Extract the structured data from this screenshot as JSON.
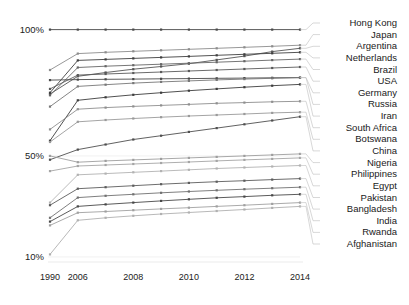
{
  "chart_data": {
    "type": "line",
    "title": "",
    "subtitle": "",
    "xlabel": "",
    "ylabel": "",
    "x": [
      1990,
      2006,
      2007,
      2008,
      2009,
      2010,
      2011,
      2012,
      2013,
      2014
    ],
    "x_tick_labels": [
      "1990",
      "2006",
      "2008",
      "2010",
      "2012",
      "2014"
    ],
    "x_ticks": [
      1990,
      2006,
      2008,
      2010,
      2012,
      2014
    ],
    "y_tick_labels": [
      "100%",
      "50%",
      "10%"
    ],
    "y_ticks": [
      100,
      50,
      10
    ],
    "ylim": [
      8,
      103
    ],
    "grid": false,
    "legend_position": "right-labels",
    "marker": "square",
    "note": "Irregular x axis: a long 1990-2006 gap then yearly steps to 2014. Right-hand country labels are evenly stacked and joined to line endpoints by thin leader lines.",
    "series": [
      {
        "name": "Hong Kong",
        "values": [
          100,
          100,
          100,
          100,
          100,
          100,
          100,
          100,
          100,
          100
        ],
        "color": "#4a4a4a"
      },
      {
        "name": "Japan",
        "values": [
          84.0,
          90.5,
          91.0,
          91.4,
          91.8,
          92.2,
          92.6,
          93.0,
          93.4,
          93.8
        ],
        "color": "#8c8c8c"
      },
      {
        "name": "Argentina",
        "values": [
          74.5,
          81.5,
          83.0,
          84.3,
          85.4,
          86.5,
          88.0,
          89.5,
          91.3,
          92.6
        ],
        "color": "#555555"
      },
      {
        "name": "Netherlands",
        "values": [
          75.0,
          87.8,
          88.2,
          88.6,
          89.0,
          89.4,
          89.8,
          90.2,
          90.6,
          91.0
        ],
        "color": "#3f3f3f"
      },
      {
        "name": "Brazil",
        "values": [
          74.0,
          85.0,
          85.5,
          85.9,
          86.3,
          86.7,
          87.1,
          87.5,
          87.9,
          88.3
        ],
        "color": "#666666"
      },
      {
        "name": "USA",
        "values": [
          76.5,
          82.0,
          82.4,
          82.8,
          83.2,
          83.6,
          84.0,
          84.4,
          84.8,
          85.2
        ],
        "color": "#5a5a5a"
      },
      {
        "name": "Germany",
        "values": [
          80.0,
          80.2,
          80.3,
          80.4,
          80.5,
          80.6,
          80.7,
          80.8,
          80.9,
          81.0
        ],
        "color": "#4a4a4a"
      },
      {
        "name": "Russia",
        "values": [
          69.5,
          77.5,
          78.2,
          78.8,
          79.3,
          79.7,
          80.1,
          80.4,
          80.7,
          81.0
        ],
        "color": "#777777"
      },
      {
        "name": "Iran",
        "values": [
          56.0,
          72.0,
          73.2,
          74.2,
          75.0,
          75.8,
          76.5,
          77.2,
          77.8,
          78.3
        ],
        "color": "#3d3d3d"
      },
      {
        "name": "South Africa",
        "values": [
          60.5,
          68.5,
          69.1,
          69.6,
          70.0,
          70.4,
          70.8,
          71.1,
          71.4,
          71.6
        ],
        "color": "#8f8f8f"
      },
      {
        "name": "Botswana",
        "values": [
          55.5,
          63.5,
          64.2,
          64.8,
          65.3,
          65.8,
          66.2,
          66.6,
          67.0,
          67.3
        ],
        "color": "#9a9a9a"
      },
      {
        "name": "China",
        "values": [
          48.5,
          52.5,
          54.5,
          56.5,
          58.0,
          59.5,
          61.0,
          62.5,
          64.0,
          65.5
        ],
        "color": "#4f4f4f"
      },
      {
        "name": "Nigeria",
        "values": [
          50.0,
          47.5,
          48.0,
          48.4,
          48.8,
          49.2,
          49.6,
          50.0,
          50.4,
          50.8
        ],
        "color": "#9e9e9e"
      },
      {
        "name": "Philippines",
        "values": [
          44.0,
          46.0,
          46.4,
          46.8,
          47.2,
          47.6,
          48.0,
          48.4,
          48.8,
          49.2
        ],
        "color": "#a5a5a5"
      },
      {
        "name": "Egypt",
        "values": [
          31.5,
          42.5,
          43.0,
          43.5,
          44.0,
          44.5,
          45.0,
          45.4,
          45.8,
          46.2
        ],
        "color": "#b2b2b2"
      },
      {
        "name": "Pakistan",
        "values": [
          30.5,
          37.0,
          37.6,
          38.2,
          38.8,
          39.3,
          39.8,
          40.2,
          40.6,
          41.0
        ],
        "color": "#5c5c5c"
      },
      {
        "name": "Bangladesh",
        "values": [
          25.5,
          33.5,
          34.2,
          34.8,
          35.4,
          35.9,
          36.4,
          36.8,
          37.2,
          37.6
        ],
        "color": "#707070"
      },
      {
        "name": "India",
        "values": [
          24.0,
          30.0,
          30.8,
          31.5,
          32.2,
          32.8,
          33.4,
          33.9,
          34.4,
          34.8
        ],
        "color": "#484848"
      },
      {
        "name": "Rwanda",
        "values": [
          22.5,
          27.5,
          28.0,
          28.5,
          29.0,
          29.5,
          30.0,
          30.5,
          31.0,
          31.5
        ],
        "color": "#a0a0a0"
      },
      {
        "name": "Afghanistan",
        "values": [
          11.0,
          24.5,
          25.5,
          26.3,
          27.0,
          27.6,
          28.2,
          28.8,
          29.4,
          30.0
        ],
        "color": "#b0b0b0"
      }
    ]
  },
  "style": {
    "background": "#ffffff",
    "line_color": "#555555",
    "text_color": "#1a1a1a",
    "leader_color": "#bdbdbd"
  }
}
